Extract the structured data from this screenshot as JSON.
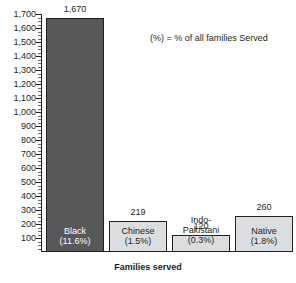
{
  "annotation": "(%) = % of all families Served",
  "axis": {
    "x_title": "Families served",
    "y_ticks": [
      "1,700",
      "1,600",
      "1,500",
      "1,400",
      "1,300",
      "1,200",
      "1,100",
      "1,000",
      "900",
      "800",
      "700",
      "600",
      "500",
      "400",
      "300",
      "200",
      "100"
    ]
  },
  "colors": {
    "dark_bar": "#58585a",
    "light_bar": "#dcdddf",
    "outline": "#231f20",
    "text": "#231f20",
    "text_on_dark": "#ffffff"
  },
  "bars": [
    {
      "name": "Black",
      "value": 1670,
      "value_label": "1,670",
      "pct": "(11.6%)",
      "label_line1": "Black",
      "label_line2": "",
      "style": "dark",
      "label_position": "inside"
    },
    {
      "name": "Chinese",
      "value": 219,
      "value_label": "219",
      "pct": "(1.5%)",
      "label_line1": "Chinese",
      "label_line2": "",
      "style": "light",
      "label_position": "inside"
    },
    {
      "name": "Indo-Pakistani",
      "value": 120,
      "value_label": "120",
      "pct": "(0.3%)",
      "label_line1": "Indo-",
      "label_line2": "Pakistani",
      "style": "light",
      "label_position": "outside"
    },
    {
      "name": "Native",
      "value": 260,
      "value_label": "260",
      "pct": "(1.8%)",
      "label_line1": "Native",
      "label_line2": "",
      "style": "light",
      "label_position": "inside"
    }
  ],
  "chart_data": {
    "type": "bar",
    "title": "",
    "subtitle": "",
    "annotation": "(%) = % of all families Served",
    "categories": [
      "Black",
      "Chinese",
      "Indo-Pakistani",
      "Native"
    ],
    "values": [
      1670,
      219,
      120,
      260
    ],
    "data_labels": [
      "1,670",
      "219",
      "120",
      "260"
    ],
    "category_percents": [
      "11.6%",
      "1.5%",
      "0.3%",
      "1.8%"
    ],
    "percent_labels": [
      "(11.6%)",
      "(1.5%)",
      "(0.3%)",
      "(1.8%)"
    ],
    "xlabel": "Families served",
    "ylabel": "",
    "ylim": [
      0,
      1700
    ],
    "ytick_interval": 100,
    "yticks": [
      100,
      200,
      300,
      400,
      500,
      600,
      700,
      800,
      900,
      1000,
      1100,
      1200,
      1300,
      1400,
      1500,
      1600,
      1700
    ],
    "ytick_labels": [
      "100",
      "200",
      "300",
      "400",
      "500",
      "600",
      "700",
      "800",
      "900",
      "1,000",
      "1,100",
      "1,200",
      "1,300",
      "1,400",
      "1,500",
      "1,600",
      "1,700"
    ],
    "grid": false,
    "legend": null,
    "series_colors": [
      "#58585a",
      "#dcdddf",
      "#dcdddf",
      "#dcdddf"
    ]
  }
}
